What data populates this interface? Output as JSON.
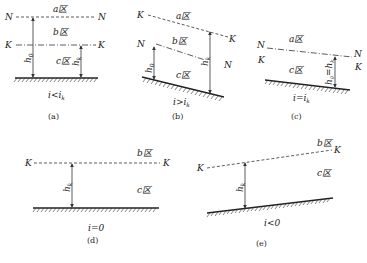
{
  "figure": {
    "panels": [
      {
        "id": "a",
        "caption": "(a)",
        "condition": "i<i",
        "condition_sub": "k",
        "lines": {
          "N_left": "N",
          "N_right": "N",
          "K_left": "K",
          "K_right": "K"
        },
        "zones": [
          "a区",
          "b区",
          "c区"
        ],
        "depths": {
          "h0": "h",
          "h0_sub": "0",
          "hk": "h",
          "hk_sub": "k"
        }
      },
      {
        "id": "b",
        "caption": "(b)",
        "condition": "i>i",
        "condition_sub": "k",
        "lines": {
          "K_left": "K",
          "K_right": "K",
          "N_left": "N",
          "N_right": "N"
        },
        "zones": [
          "a区",
          "b区",
          "c区"
        ],
        "depths": {
          "h0": "h",
          "h0_sub": "0",
          "hk": "h",
          "hk_sub": "k"
        }
      },
      {
        "id": "c",
        "caption": "(c)",
        "condition": "i=i",
        "condition_sub": "k",
        "lines": {
          "N_left": "N",
          "K_left": "K",
          "N_right": "N",
          "K_right": "K"
        },
        "zones": [
          "a区",
          "c区"
        ],
        "depths": {
          "label": "h0=hk"
        }
      },
      {
        "id": "d",
        "caption": "(d)",
        "condition": "i=0",
        "lines": {
          "K_left": "K",
          "K_right": "K"
        },
        "zones": [
          "b区",
          "c区"
        ],
        "depths": {
          "hk": "h",
          "hk_sub": "k"
        }
      },
      {
        "id": "e",
        "caption": "(e)",
        "condition": "i<0",
        "lines": {
          "K_left": "K",
          "K_right": "K"
        },
        "zones": [
          "b区",
          "c区"
        ],
        "depths": {
          "hk": "h",
          "hk_sub": "k"
        }
      }
    ]
  }
}
